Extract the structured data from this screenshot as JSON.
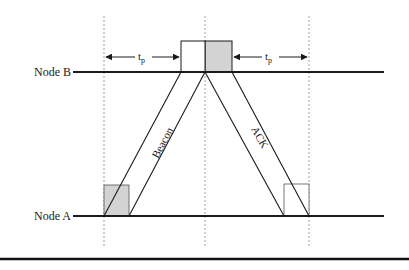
{
  "diagram": {
    "nodes": {
      "node_b": "Node B",
      "node_a": "Node A"
    },
    "packets": {
      "beacon": "Beacon",
      "ack": "ACK"
    },
    "intervals": {
      "left_tp": {
        "base": "t",
        "sub": "p"
      },
      "right_tp": {
        "base": "t",
        "sub": "p"
      }
    },
    "colors": {
      "line": "#1a1a1a",
      "shade": "#d3d3d3",
      "dashed": "#888888"
    }
  }
}
